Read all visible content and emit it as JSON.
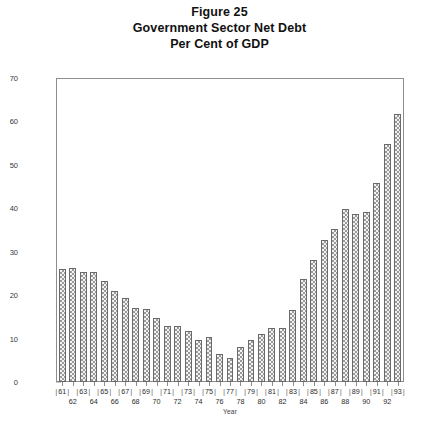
{
  "title": {
    "line1": "Figure 25",
    "line2": "Government Sector Net Debt",
    "line3": "Per Cent of GDP"
  },
  "chart_data": {
    "type": "bar",
    "xlabel": "Year",
    "ylabel": "",
    "ylim": [
      0,
      70
    ],
    "yticks": [
      0,
      10,
      20,
      30,
      40,
      50,
      60,
      70
    ],
    "grid": false,
    "legend": null,
    "categories": [
      "61",
      "62",
      "63",
      "64",
      "65",
      "66",
      "67",
      "68",
      "69",
      "70",
      "71",
      "72",
      "73",
      "74",
      "75",
      "76",
      "77",
      "78",
      "79",
      "80",
      "81",
      "82",
      "83",
      "84",
      "85",
      "86",
      "87",
      "88",
      "89",
      "90",
      "91",
      "92",
      "93"
    ],
    "values": [
      26.2,
      26.3,
      25.4,
      25.4,
      23.4,
      21.0,
      19.4,
      17.0,
      16.8,
      14.8,
      13.0,
      12.9,
      11.7,
      9.6,
      10.5,
      6.5,
      5.6,
      8.0,
      9.6,
      11.2,
      12.5,
      12.5,
      16.6,
      23.8,
      28.2,
      32.8,
      35.4,
      40.0,
      38.8,
      39.2,
      46.0,
      55.0,
      62.0
    ],
    "series_name": "Government sector net debt (% of GDP)",
    "bar_fill": "checkerboard-hatch",
    "bar_color": "#9a9a9a",
    "bar_outline": "#6a6a6a",
    "frame_color": "#8d8d8d"
  },
  "axis": {
    "x_title": "Year",
    "x_labels_top": [
      "61",
      "63",
      "65",
      "67",
      "69",
      "71",
      "73",
      "75",
      "77",
      "79",
      "81",
      "83",
      "85",
      "87",
      "89",
      "91",
      "93"
    ],
    "x_labels_bottom": [
      "62",
      "64",
      "66",
      "68",
      "70",
      "72",
      "74",
      "76",
      "78",
      "80",
      "82",
      "84",
      "86",
      "88",
      "90",
      "92"
    ],
    "separator": "|"
  }
}
